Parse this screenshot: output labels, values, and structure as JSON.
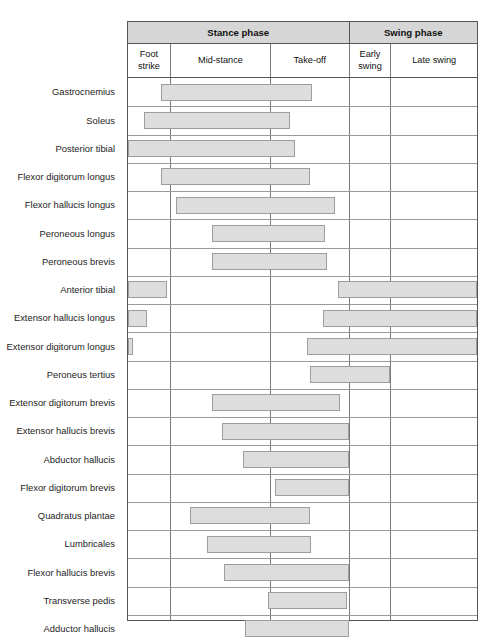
{
  "chart_data": {
    "type": "bar",
    "xlabel": "Gait cycle phase",
    "ylabel": "Muscle",
    "grid": true,
    "legend": "none",
    "axis_note": "Horizontal axis is the gait cycle divided into five phases; horizontal bars show the interval of activity for each muscle.",
    "phases": [
      {
        "label": "Stance phase",
        "sub": [
          "Foot strike",
          "Mid-stance",
          "Take-off"
        ]
      },
      {
        "label": "Swing phase",
        "sub": [
          "Early swing",
          "Late swing"
        ]
      }
    ],
    "phase_groups": [
      {
        "name": "Stance phase",
        "start_pct": 0,
        "end_pct": 63.2
      },
      {
        "name": "Swing phase",
        "start_pct": 63.2,
        "end_pct": 100
      }
    ],
    "columns": [
      {
        "name": "Foot strike",
        "start_pct": 0,
        "end_pct": 12.0
      },
      {
        "name": "Mid-stance",
        "start_pct": 12.0,
        "end_pct": 40.7
      },
      {
        "name": "Take-off",
        "start_pct": 40.7,
        "end_pct": 63.2
      },
      {
        "name": "Early swing",
        "start_pct": 63.2,
        "end_pct": 75.2
      },
      {
        "name": "Late swing",
        "start_pct": 75.2,
        "end_pct": 100
      }
    ],
    "categories": [
      "Gastrocnemius",
      "Soleus",
      "Posterior tibial",
      "Flexor digitorum longus",
      "Flexor hallucis longus",
      "Peroneous longus",
      "Peroneous brevis",
      "Anterior tibial",
      "Extensor hallucis longus",
      "Extensor digitorum longus",
      "Peroneus tertius",
      "Extensor digitorum brevis",
      "Extensor hallucis brevis",
      "Abductor hallucis",
      "Flexor digitorum brevis",
      "Quadratus plantae",
      "Lumbricales",
      "Flexor hallucis brevis",
      "Transverse pedis",
      "Adductor hallucis"
    ],
    "rows": [
      {
        "muscle": "Gastrocnemius",
        "intervals": [
          {
            "start_pct": 9.4,
            "end_pct": 52.7
          }
        ]
      },
      {
        "muscle": "Soleus",
        "intervals": [
          {
            "start_pct": 4.6,
            "end_pct": 46.4
          }
        ]
      },
      {
        "muscle": "Posterior tibial",
        "intervals": [
          {
            "start_pct": 0.0,
            "end_pct": 47.9
          }
        ]
      },
      {
        "muscle": "Flexor digitorum longus",
        "intervals": [
          {
            "start_pct": 9.4,
            "end_pct": 52.1
          }
        ]
      },
      {
        "muscle": "Flexor hallucis longus",
        "intervals": [
          {
            "start_pct": 13.7,
            "end_pct": 59.3
          }
        ]
      },
      {
        "main": "Peroneous longus",
        "muscle": "Peroneous longus",
        "intervals": [
          {
            "start_pct": 24.2,
            "end_pct": 56.4
          }
        ]
      },
      {
        "muscle": "Peroneous brevis",
        "intervals": [
          {
            "start_pct": 24.2,
            "end_pct": 57.0
          }
        ]
      },
      {
        "muscle": "Anterior tibial",
        "intervals": [
          {
            "start_pct": 0.0,
            "end_pct": 11.1
          },
          {
            "start_pct": 60.1,
            "end_pct": 100.0
          }
        ]
      },
      {
        "muscle": "Extensor hallucis longus",
        "intervals": [
          {
            "start_pct": 0.0,
            "end_pct": 5.4
          },
          {
            "start_pct": 55.8,
            "end_pct": 100.0
          }
        ]
      },
      {
        "muscle": "Extensor digitorum longus",
        "intervals": [
          {
            "start_pct": 0.0,
            "end_pct": 1.4
          },
          {
            "start_pct": 51.3,
            "end_pct": 100.0
          }
        ]
      },
      {
        "muscle": "Peroneus tertius",
        "intervals": [
          {
            "start_pct": 52.1,
            "end_pct": 75.2
          }
        ]
      },
      {
        "muscle": "Extensor digitorum brevis",
        "intervals": [
          {
            "start_pct": 24.2,
            "end_pct": 60.7
          }
        ]
      },
      {
        "muscle": "Extensor hallucis brevis",
        "intervals": [
          {
            "start_pct": 26.8,
            "end_pct": 63.2
          }
        ]
      },
      {
        "muscle": "Abductor hallucis",
        "intervals": [
          {
            "start_pct": 33.0,
            "end_pct": 63.2
          }
        ]
      },
      {
        "muscle": "Flexor digitorum brevis",
        "intervals": [
          {
            "start_pct": 42.2,
            "end_pct": 63.2
          }
        ]
      },
      {
        "muscle": "Quadratus plantae",
        "intervals": [
          {
            "start_pct": 17.9,
            "end_pct": 52.1
          }
        ]
      },
      {
        "muscle": "Lumbricales",
        "intervals": [
          {
            "start_pct": 22.5,
            "end_pct": 52.4
          }
        ]
      },
      {
        "muscle": "Flexor hallucis brevis",
        "intervals": [
          {
            "start_pct": 27.4,
            "end_pct": 63.2
          }
        ]
      },
      {
        "muscle": "Transverse pedis",
        "intervals": [
          {
            "start_pct": 40.2,
            "end_pct": 62.7
          }
        ]
      },
      {
        "muscle": "Adductor hallucis",
        "intervals": [
          {
            "start_pct": 33.6,
            "end_pct": 63.2
          }
        ]
      }
    ]
  },
  "colors": {
    "bar_fill": "#dddddd",
    "bar_border": "#9d9d9d",
    "header_fill": "#d6d6d6",
    "grid_line": "#9a9a9a",
    "table_border": "#565656",
    "text": "#1d1d1d",
    "background": "#ffffff"
  }
}
